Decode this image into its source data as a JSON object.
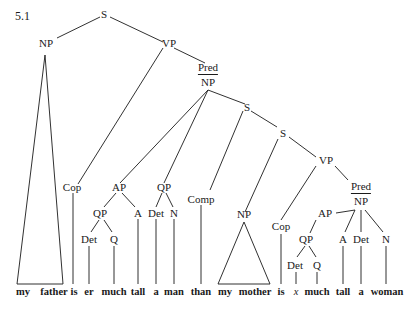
{
  "example_number": "5.1",
  "nodes": {
    "s_root": "S",
    "np_subj": "NP",
    "vp_main": "VP",
    "pred_np_main": {
      "top": "Pred",
      "bottom": "NP"
    },
    "cop_1": "Cop",
    "ap_1": "AP",
    "qp_1": "QP",
    "det_1": "Det",
    "q_1": "Q",
    "a_1": "A",
    "qp_2": "QP",
    "det_2": "Det",
    "n_1": "N",
    "s_2": "S",
    "comp": "Comp",
    "s_3": "S",
    "np_2": "NP",
    "vp_2": "VP",
    "cop_2": "Cop",
    "pred_np_2": {
      "top": "Pred",
      "bottom": "NP"
    },
    "ap_2": "AP",
    "qp_3": "QP",
    "det_3": "Det",
    "q_2": "Q",
    "a_2": "A",
    "det_4": "Det",
    "n_2": "N"
  },
  "words": [
    "my",
    "father",
    "is",
    "er",
    "much",
    "tall",
    "a",
    "man",
    "than",
    "my",
    "mother",
    "is",
    "x",
    "much",
    "tall",
    "a",
    "woman"
  ]
}
